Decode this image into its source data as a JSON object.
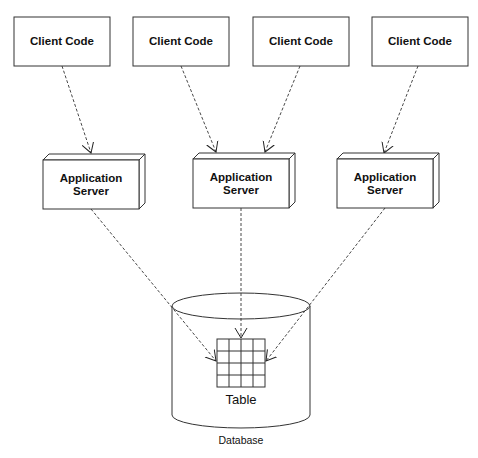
{
  "diagram": {
    "clients": [
      {
        "label": "Client Code"
      },
      {
        "label": "Client Code"
      },
      {
        "label": "Client Code"
      },
      {
        "label": "Client Code"
      }
    ],
    "servers": [
      {
        "line1": "Application",
        "line2": "Server"
      },
      {
        "line1": "Application",
        "line2": "Server"
      },
      {
        "line1": "Application",
        "line2": "Server"
      }
    ],
    "database": {
      "table_label": "Table",
      "label": "Database",
      "grid_rows": 4,
      "grid_cols": 4
    },
    "connections": [
      {
        "from": "client-1",
        "to": "server-1"
      },
      {
        "from": "client-2",
        "to": "server-2"
      },
      {
        "from": "client-3",
        "to": "server-2"
      },
      {
        "from": "client-4",
        "to": "server-3"
      },
      {
        "from": "server-1",
        "to": "table"
      },
      {
        "from": "server-2",
        "to": "table"
      },
      {
        "from": "server-3",
        "to": "table"
      }
    ],
    "colors": {
      "stroke": "#222222",
      "background": "#ffffff"
    }
  }
}
